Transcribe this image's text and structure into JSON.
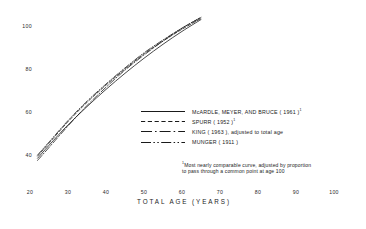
{
  "chart_data": {
    "type": "line",
    "title": "",
    "subtitle": "",
    "xlabel": "TOTAL AGE (YEARS)",
    "ylabel": "",
    "xlim": [
      20,
      100
    ],
    "ylim": [
      30,
      110
    ],
    "xticks": [
      20,
      30,
      40,
      50,
      60,
      70,
      80,
      90,
      100
    ],
    "yticks": [
      40,
      60,
      80,
      100
    ],
    "grid": false,
    "legend_position": "center-right",
    "footnote": "Most nearly comparable curve, adjusted by proportion to pass through a common point at age 100",
    "footnote_line1": "Most nearly comparable curve, adjusted by proportion",
    "footnote_line2": "to pass through a common point at age 100",
    "footnote_marker": "1",
    "series": [
      {
        "name": "McARDLE, MEYER, AND BRUCE ( 1961 )",
        "marker": "1",
        "style": "solid",
        "x": [
          22,
          25,
          30,
          35,
          40,
          45,
          50,
          55,
          60,
          65
        ],
        "values": [
          38.5,
          44.5,
          54.0,
          62.5,
          70.5,
          78.0,
          85.0,
          91.5,
          97.5,
          103.0
        ]
      },
      {
        "name": "SPURR ( 1952 )",
        "marker": "1",
        "style": "dashed",
        "x": [
          22,
          25,
          30,
          35,
          40,
          45,
          50,
          55,
          60,
          65
        ],
        "values": [
          39.5,
          45.5,
          55.5,
          64.5,
          72.5,
          80.0,
          87.0,
          93.0,
          98.5,
          103.5
        ]
      },
      {
        "name": "KING ( 1963 ), adjusted to total age",
        "marker": "",
        "style": "dash-dot",
        "x": [
          22,
          25,
          30,
          35,
          40,
          45,
          50,
          55,
          60,
          65
        ],
        "values": [
          37.5,
          43.5,
          53.5,
          63.0,
          71.5,
          79.5,
          86.5,
          93.0,
          99.0,
          104.0
        ]
      },
      {
        "name": "MUNGER ( 1911 )",
        "marker": "",
        "style": "dash-dot-dot",
        "x": [
          22,
          25,
          30,
          35,
          40,
          45,
          50,
          55,
          60,
          65
        ],
        "values": [
          40.0,
          46.0,
          56.0,
          65.0,
          73.0,
          80.5,
          87.5,
          93.5,
          99.0,
          104.0
        ]
      }
    ]
  },
  "axis": {
    "y_tick_labels": [
      "100",
      "80",
      "60",
      "40"
    ],
    "x_tick_labels": [
      "20",
      "30",
      "40",
      "50",
      "60",
      "70",
      "80",
      "90",
      "100"
    ],
    "x_title": "TOTAL AGE (YEARS)"
  },
  "legend": {
    "items": [
      {
        "label": "McARDLE, MEYER, AND BRUCE ( 1961 )",
        "marker": "1",
        "style": "solid"
      },
      {
        "label": "SPURR ( 1952 )",
        "marker": "1",
        "style": "dashed"
      },
      {
        "label": "KING ( 1963 ), adjusted to total age",
        "marker": "",
        "style": "dash-dot"
      },
      {
        "label": "MUNGER ( 1911 )",
        "marker": "",
        "style": "dash-dot-dot"
      }
    ]
  }
}
